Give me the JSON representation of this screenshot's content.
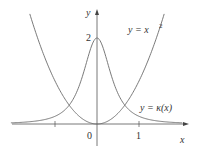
{
  "chart_data": {
    "type": "line",
    "title": "",
    "xlabel": "x",
    "ylabel": "y",
    "xlim": [
      -2.0,
      2.15
    ],
    "ylim": [
      -0.5,
      2.7
    ],
    "grid": false,
    "x_ticks": [
      -1,
      0,
      1
    ],
    "x_tick_labels": [
      "",
      "0",
      "1"
    ],
    "y_ticks": [
      2
    ],
    "y_tick_labels": [
      "2"
    ],
    "series": [
      {
        "name": "y = x²",
        "formula": "x^2",
        "x": [
          -1.6,
          -1.2,
          -0.8,
          -0.4,
          0,
          0.4,
          0.8,
          1.2,
          1.6
        ],
        "values": [
          2.56,
          1.44,
          0.64,
          0.16,
          0,
          0.16,
          0.64,
          1.44,
          2.56
        ]
      },
      {
        "name": "y = κ(x)",
        "formula": "2/(1+4x^2)^(3/2)",
        "x": [
          -2.0,
          -1.5,
          -1.0,
          -0.5,
          0,
          0.5,
          1.0,
          1.5,
          2.0
        ],
        "values": [
          0.027,
          0.063,
          0.179,
          0.707,
          2.0,
          0.707,
          0.179,
          0.063,
          0.027
        ]
      }
    ],
    "annotations": [
      {
        "text": "y = x²",
        "near": "upper right of parabola"
      },
      {
        "text": "y = κ(x)",
        "near": "right tail of curvature curve"
      }
    ]
  },
  "labels": {
    "y_axis": "y",
    "x_axis": "x",
    "tick_zero": "0",
    "tick_one": "1",
    "tick_two": "2",
    "parabola_label_lhs": "y = x",
    "parabola_label_exp": "2",
    "kappa_label": "y = κ(x)"
  },
  "colors": {
    "curve": "#6b6b6b",
    "axis": "#555555",
    "text": "#333333"
  }
}
